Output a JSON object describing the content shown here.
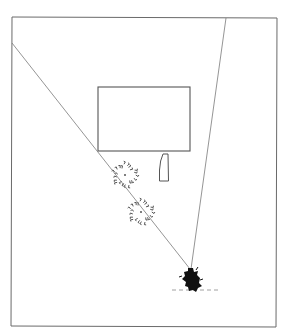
{
  "diagram": {
    "title": "",
    "type": "plan-view field-of-view sketch",
    "colors": {
      "background": "#ffffff",
      "stroke": "#555555",
      "frame": "#6a6a6a",
      "figure": "#111111"
    },
    "elements": [
      {
        "id": "frame",
        "label": "frame border"
      },
      {
        "id": "building",
        "label": "rectangular building"
      },
      {
        "id": "small-object",
        "label": "small elongated object"
      },
      {
        "id": "tree-1",
        "label": "tree"
      },
      {
        "id": "tree-2",
        "label": "tree"
      },
      {
        "id": "viewer",
        "label": "viewer figure (top view)"
      },
      {
        "id": "sightline-left",
        "label": "left sightline"
      },
      {
        "id": "sightline-right",
        "label": "right sightline"
      },
      {
        "id": "ground-line",
        "label": "dashed ground line"
      }
    ]
  }
}
